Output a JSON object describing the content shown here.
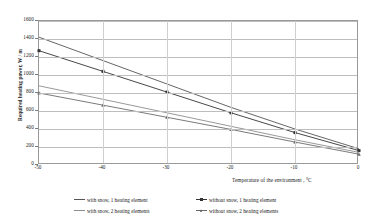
{
  "chart_data": {
    "type": "line",
    "title": "",
    "xlabel": "Temperature of the environment , °C",
    "ylabel": "Required heating power, W / m",
    "xlim": [
      -50,
      0
    ],
    "ylim": [
      0,
      1600
    ],
    "grid": true,
    "legend_position": "bottom",
    "x": [
      -50,
      -40,
      -30,
      -20,
      -10,
      0
    ],
    "xticks": [
      "-50",
      "-40",
      "-30",
      "-20",
      "-10",
      "0"
    ],
    "yticks": [
      "0",
      "200",
      "400",
      "600",
      "800",
      "1000",
      "1200",
      "1400",
      "1600"
    ],
    "series": [
      {
        "name": "with snow, 1 heating element",
        "color": "#555555",
        "marker": "none",
        "values": [
          1420,
          1160,
          900,
          640,
          400,
          180
        ]
      },
      {
        "name": "without snow, 1 heating element",
        "color": "#333333",
        "marker": "square",
        "values": [
          1270,
          1040,
          810,
          580,
          360,
          160
        ]
      },
      {
        "name": "with snow, 2 heating elements",
        "color": "#8d8d8d",
        "marker": "none",
        "values": [
          880,
          730,
          580,
          430,
          280,
          140
        ]
      },
      {
        "name": "without snow, 2 heating elements",
        "color": "#6b6b6b",
        "marker": "triangle",
        "values": [
          800,
          665,
          530,
          395,
          255,
          120
        ]
      }
    ]
  },
  "axes": {
    "y_title": "Required heating power, W / m",
    "x_title": "Temperature of the environment , °C"
  },
  "legend": {
    "items": [
      {
        "label": "with snow, 1 heating element"
      },
      {
        "label": "without snow, 1 heating element"
      },
      {
        "label": "with snow, 2 heating elements"
      },
      {
        "label": "without snow, 2 heating elements"
      }
    ]
  }
}
